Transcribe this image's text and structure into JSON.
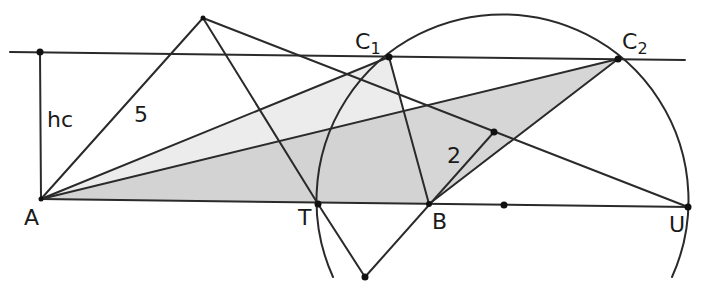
{
  "diagram": {
    "colors": {
      "line": "#2a2a2a",
      "fill_light": "#ececec",
      "fill_dark": "#cfcfcf",
      "point": "#111111",
      "background": "#ffffff"
    },
    "labels": {
      "A": "A",
      "T": "T",
      "B": "B",
      "U": "U",
      "C1_main": "C",
      "C1_sub": "1",
      "C2_main": "C",
      "C2_sub": "2",
      "hc": "hc",
      "side5": "5",
      "side2": "2"
    },
    "points": {
      "A": [
        41,
        199
      ],
      "H": [
        40,
        52
      ],
      "P": [
        203,
        18
      ],
      "C1": [
        389,
        57
      ],
      "C2": [
        618,
        59
      ],
      "T": [
        318,
        204
      ],
      "B": [
        429,
        204
      ],
      "M": [
        504,
        205
      ],
      "U": [
        688,
        207
      ],
      "Q": [
        365,
        277
      ],
      "R": [
        494,
        132
      ]
    },
    "circle": {
      "center": [
        503,
        205
      ],
      "radius": 186
    }
  }
}
